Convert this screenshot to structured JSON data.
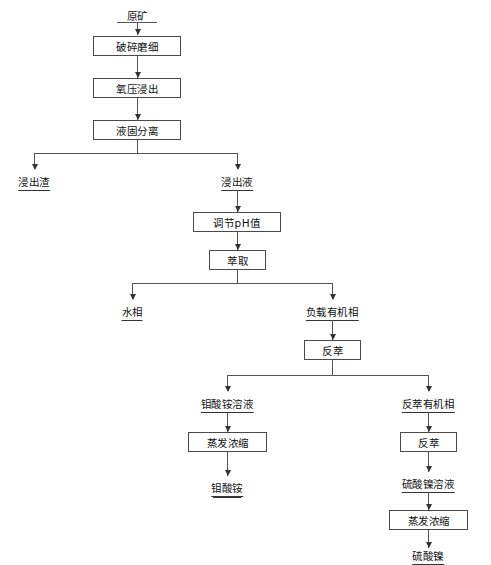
{
  "diagram": {
    "type": "process-flowchart",
    "background_color": "#ffffff",
    "line_color": "#555555",
    "text_color": "#111111"
  },
  "nodes": {
    "raw_ore": "原矿",
    "crush_grind": "破碎磨细",
    "oxygen_pressure_leach": "氧压浸出",
    "liquid_solid_separation": "液固分离",
    "leach_residue": "浸出渣",
    "leach_liquor": "浸出液",
    "adjust_ph": "调节pH值",
    "extraction": "萃取",
    "aqueous_phase": "水相",
    "loaded_organic_phase": "负载有机相",
    "stripping_1": "反萃",
    "ammonium_molybdate_solution": "钼酸铵溶液",
    "stripped_organic_phase": "反萃有机相",
    "evaporation_concentration_1": "蒸发浓缩",
    "ammonium_molybdate": "钼酸铵",
    "stripping_2": "反萃",
    "nickel_sulfate_solution": "硫酸镍溶液",
    "evaporation_concentration_2": "蒸发浓缩",
    "nickel_sulfate": "硫酸镍"
  },
  "flow_edges": [
    {
      "from": "原矿",
      "to": "破碎磨细"
    },
    {
      "from": "破碎磨细",
      "to": "氧压浸出"
    },
    {
      "from": "氧压浸出",
      "to": "液固分离"
    },
    {
      "from": "液固分离",
      "to": "浸出渣"
    },
    {
      "from": "液固分离",
      "to": "浸出液"
    },
    {
      "from": "浸出液",
      "to": "调节pH值"
    },
    {
      "from": "调节pH值",
      "to": "萃取"
    },
    {
      "from": "萃取",
      "to": "水相"
    },
    {
      "from": "萃取",
      "to": "负载有机相"
    },
    {
      "from": "负载有机相",
      "to": "反萃"
    },
    {
      "from": "反萃",
      "to": "钼酸铵溶液"
    },
    {
      "from": "反萃",
      "to": "反萃有机相"
    },
    {
      "from": "钼酸铵溶液",
      "to": "蒸发浓缩"
    },
    {
      "from": "蒸发浓缩",
      "to": "钼酸铵"
    },
    {
      "from": "反萃有机相",
      "to": "反萃"
    },
    {
      "from": "反萃",
      "to": "硫酸镍溶液"
    },
    {
      "from": "硫酸镍溶液",
      "to": "蒸发浓缩"
    },
    {
      "from": "蒸发浓缩",
      "to": "硫酸镍"
    }
  ]
}
